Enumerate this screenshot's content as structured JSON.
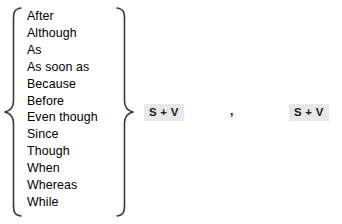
{
  "diagram": {
    "conjunctions": [
      "After",
      "Although",
      "As",
      "As soon as",
      "Because",
      "Before",
      "Even though",
      "Since",
      "Though",
      "When",
      "Whereas",
      "While"
    ],
    "clause_pattern": {
      "first_clause": "S + V",
      "separator": ",",
      "second_clause": "S + V"
    },
    "colors": {
      "text": "#000000",
      "brace_stroke": "#3a3a3a",
      "highlight_background": "#e8e8e8",
      "page_background": "#ffffff"
    }
  }
}
